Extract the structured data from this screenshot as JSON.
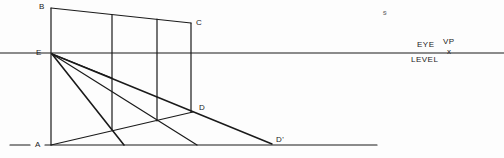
{
  "labels": {
    "B": "B",
    "C": "C",
    "E": "E",
    "A": "A",
    "D": "D",
    "D_prime": "D'",
    "eye": "EYE",
    "level": "LEVEL",
    "vp": "VP",
    "vp_mark": "x",
    "stray_mark": "ᵴ"
  },
  "colors": {
    "ink": "#1a1a1a",
    "paper": "#fdfdfd"
  }
}
